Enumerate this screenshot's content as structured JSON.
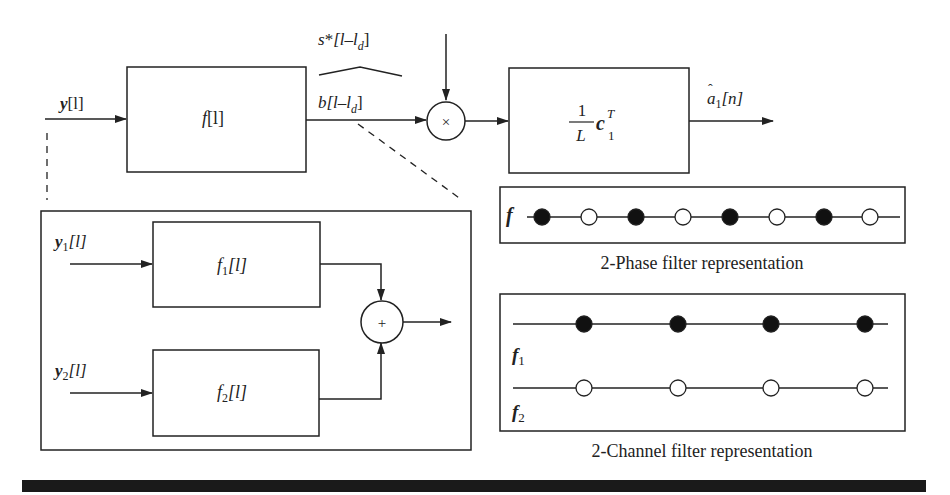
{
  "top_chain": {
    "input": {
      "sym": "y",
      "arg": "[l]"
    },
    "filter_block": {
      "sym": "f",
      "arg": "[l]"
    },
    "conjugate_label": {
      "sym": "s",
      "star": "*",
      "open": "[l–l",
      "sub": "d",
      "close": "]"
    },
    "branch_label": {
      "sym": "b",
      "open": "[l–l",
      "sub": "d",
      "close": "]"
    },
    "multiplier": {
      "symbol": "×"
    },
    "correlator_block": {
      "num": "1",
      "den": "L",
      "vec": "c",
      "sup": "T",
      "sub": "1"
    },
    "output": {
      "hat": "ˆ",
      "sym": "a",
      "sub": "1",
      "arg": "[n]"
    }
  },
  "expanded_filter": {
    "input1": {
      "sym": "y",
      "sub": "1",
      "arg": "[l]"
    },
    "input2": {
      "sym": "y",
      "sub": "2",
      "arg": "[l]"
    },
    "block1": {
      "sym": "f",
      "sub": "1",
      "arg": "[l]"
    },
    "block2": {
      "sym": "f",
      "sub": "2",
      "arg": "[l]"
    },
    "adder": {
      "symbol": "+"
    }
  },
  "phase_panel": {
    "label": "f",
    "taps": [
      "filled",
      "open",
      "filled",
      "open",
      "filled",
      "open",
      "filled",
      "open"
    ],
    "caption": "2-Phase filter representation"
  },
  "channel_panel": {
    "row1_label": {
      "sym": "f",
      "sub": "1"
    },
    "row2_label": {
      "sym": "f",
      "sub": "2"
    },
    "row1_taps": [
      "filled",
      "filled",
      "filled",
      "filled"
    ],
    "row2_taps": [
      "open",
      "open",
      "open",
      "open"
    ],
    "caption": "2-Channel filter representation"
  },
  "colors": {
    "ink": "#222222",
    "rule": "#1a1a1a",
    "background": "#ffffff"
  }
}
